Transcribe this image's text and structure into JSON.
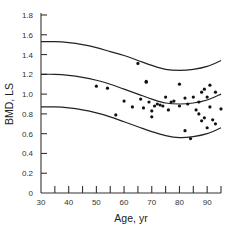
{
  "chart_data": {
    "type": "scatter",
    "title": "",
    "xlabel": "Age, yr",
    "ylabel": "BMD, LS",
    "xlim": [
      30,
      95
    ],
    "ylim": [
      0,
      1.8
    ],
    "x_ticks": [
      30,
      40,
      50,
      60,
      70,
      80,
      90
    ],
    "x_minor_step": 5,
    "y_ticks": [
      0,
      0.2,
      0.4,
      0.6,
      0.8,
      1.0,
      1.2,
      1.4,
      1.6,
      1.8
    ],
    "y_tick_labels": [
      "0",
      "0.2",
      "0.4",
      "0.6",
      "0.8",
      "1.0",
      "1.2",
      "1.4",
      "1.6",
      "1.8"
    ],
    "grid": false,
    "legend": null,
    "reference_curves": [
      {
        "name": "upper",
        "x": [
          30,
          35,
          40,
          45,
          50,
          55,
          60,
          65,
          70,
          75,
          80,
          85,
          90,
          95
        ],
        "y": [
          1.53,
          1.53,
          1.52,
          1.5,
          1.47,
          1.43,
          1.39,
          1.34,
          1.29,
          1.25,
          1.24,
          1.25,
          1.28,
          1.34
        ]
      },
      {
        "name": "mean",
        "x": [
          30,
          35,
          40,
          45,
          50,
          55,
          60,
          65,
          70,
          75,
          80,
          85,
          90,
          95
        ],
        "y": [
          1.2,
          1.2,
          1.19,
          1.17,
          1.14,
          1.1,
          1.05,
          1.0,
          0.95,
          0.91,
          0.9,
          0.91,
          0.94,
          1.0
        ]
      },
      {
        "name": "lower",
        "x": [
          30,
          35,
          40,
          45,
          50,
          55,
          60,
          65,
          70,
          75,
          80,
          85,
          90,
          95
        ],
        "y": [
          0.87,
          0.87,
          0.86,
          0.84,
          0.81,
          0.77,
          0.72,
          0.67,
          0.62,
          0.58,
          0.56,
          0.57,
          0.6,
          0.66
        ]
      }
    ],
    "points": [
      {
        "x": 50,
        "y": 1.08
      },
      {
        "x": 54,
        "y": 1.06
      },
      {
        "x": 57,
        "y": 0.79
      },
      {
        "x": 60,
        "y": 0.93
      },
      {
        "x": 63,
        "y": 0.87
      },
      {
        "x": 65,
        "y": 1.31
      },
      {
        "x": 66,
        "y": 0.95
      },
      {
        "x": 67,
        "y": 0.86
      },
      {
        "x": 68,
        "y": 1.13
      },
      {
        "x": 68,
        "y": 1.12
      },
      {
        "x": 69,
        "y": 0.92
      },
      {
        "x": 70,
        "y": 0.83
      },
      {
        "x": 70,
        "y": 0.77
      },
      {
        "x": 71,
        "y": 0.88
      },
      {
        "x": 72,
        "y": 0.9
      },
      {
        "x": 73,
        "y": 0.89
      },
      {
        "x": 74,
        "y": 0.88
      },
      {
        "x": 75,
        "y": 0.97
      },
      {
        "x": 76,
        "y": 0.84
      },
      {
        "x": 77,
        "y": 0.92
      },
      {
        "x": 78,
        "y": 0.93
      },
      {
        "x": 80,
        "y": 1.1
      },
      {
        "x": 80,
        "y": 0.88
      },
      {
        "x": 82,
        "y": 0.96
      },
      {
        "x": 82,
        "y": 0.63
      },
      {
        "x": 83,
        "y": 0.9
      },
      {
        "x": 84,
        "y": 0.55
      },
      {
        "x": 85,
        "y": 0.97
      },
      {
        "x": 86,
        "y": 0.84
      },
      {
        "x": 87,
        "y": 0.92
      },
      {
        "x": 87,
        "y": 0.8
      },
      {
        "x": 88,
        "y": 1.02
      },
      {
        "x": 88,
        "y": 0.73
      },
      {
        "x": 89,
        "y": 1.05
      },
      {
        "x": 89,
        "y": 0.76
      },
      {
        "x": 90,
        "y": 0.97
      },
      {
        "x": 90,
        "y": 0.66
      },
      {
        "x": 91,
        "y": 1.09
      },
      {
        "x": 91,
        "y": 0.87
      },
      {
        "x": 92,
        "y": 0.74
      },
      {
        "x": 93,
        "y": 1.02
      },
      {
        "x": 93,
        "y": 0.7
      },
      {
        "x": 95,
        "y": 0.85
      }
    ]
  }
}
